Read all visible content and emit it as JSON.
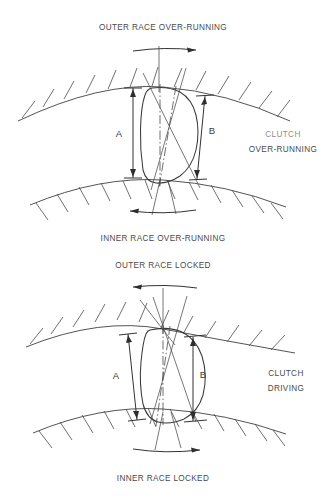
{
  "figure": {
    "title_semantic": "sprag-one-way-clutch-operation-diagram",
    "background_color": "#ffffff",
    "line_color": "#3f3f3f",
    "text_color": "#4a4a4a"
  },
  "panels": [
    {
      "id": "over-running",
      "top_label": "OUTER RACE OVER-RUNNING",
      "bottom_label": "INNER RACE OVER-RUNNING",
      "side_label_line1": "CLUTCH",
      "side_label_line2": "OVER-RUNNING",
      "dimension_a": "A",
      "dimension_b": "B",
      "outer_race_arrow_direction": "right",
      "inner_race_arrow_direction": "left",
      "sprag_state": "upright",
      "note": "A is greater than B, sprag stands tall and does not wedge"
    },
    {
      "id": "locked",
      "top_label": "OUTER RACE LOCKED",
      "bottom_label": "INNER RACE LOCKED",
      "side_label_line1": "CLUTCH",
      "side_label_line2": "DRIVING",
      "dimension_a": "A",
      "dimension_b": "B",
      "outer_race_arrow_direction": "left",
      "inner_race_arrow_direction": "right",
      "sprag_state": "tilted",
      "note": "Sprag tilts so A and B become equal and wedge the races"
    }
  ]
}
